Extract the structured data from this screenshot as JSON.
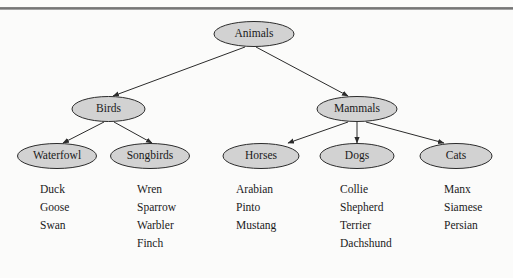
{
  "diagram": {
    "type": "tree",
    "colors": {
      "node_fill": "#d2d2d2",
      "node_stroke": "#2b2b2b",
      "text": "#1a1a1a",
      "background": "#fbfbfa",
      "rule": "#6f6f6f"
    },
    "root": {
      "id": "animals",
      "label": "Animals"
    },
    "level2": [
      {
        "id": "birds",
        "label": "Birds"
      },
      {
        "id": "mammals",
        "label": "Mammals"
      }
    ],
    "level3": [
      {
        "id": "waterfowl",
        "label": "Waterfowl",
        "parent": "birds"
      },
      {
        "id": "songbirds",
        "label": "Songbirds",
        "parent": "birds"
      },
      {
        "id": "horses",
        "label": "Horses",
        "parent": "mammals"
      },
      {
        "id": "dogs",
        "label": "Dogs",
        "parent": "mammals"
      },
      {
        "id": "cats",
        "label": "Cats",
        "parent": "mammals"
      }
    ],
    "leaf_lists": [
      {
        "id": "waterfowl-list",
        "parent": "waterfowl",
        "items": [
          "Duck",
          "Goose",
          "Swan"
        ]
      },
      {
        "id": "songbirds-list",
        "parent": "songbirds",
        "items": [
          "Wren",
          "Sparrow",
          "Warbler",
          "Finch"
        ]
      },
      {
        "id": "horses-list",
        "parent": "horses",
        "items": [
          "Arabian",
          "Pinto",
          "Mustang"
        ]
      },
      {
        "id": "dogs-list",
        "parent": "dogs",
        "items": [
          "Collie",
          "Shepherd",
          "Terrier",
          "Dachshund"
        ]
      },
      {
        "id": "cats-list",
        "parent": "cats",
        "items": [
          "Manx",
          "Siamese",
          "Persian"
        ]
      }
    ]
  }
}
